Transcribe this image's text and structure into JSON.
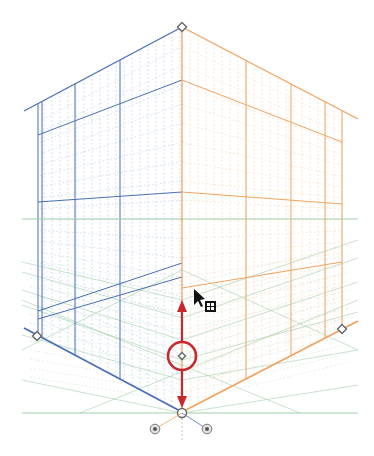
{
  "tool": {
    "name": "Perspective Grid",
    "mode": "two-point",
    "active_widget": "vertical-grid-extent"
  },
  "colors": {
    "left_plane": "#4a6fb5",
    "left_plane_minor": "#b9c8e4",
    "right_plane": "#f0a460",
    "right_plane_minor": "#f6d3b2",
    "ground_plane": "#8fc49a",
    "ground_plane_minor": "#c9e2cd",
    "horizon": "#9fcfa8",
    "active_widget": "#c8282c",
    "handle_stroke": "#666666",
    "handle_fill": "#ffffff",
    "cursor": "#111111"
  },
  "widgets": {
    "top_handle": "vertical-grid-extent-handle",
    "left_handle": "left-grid-extent-handle",
    "right_handle": "right-grid-extent-handle",
    "origin_handle": "ground-level-handle",
    "center_handle": "grid-cell-size-handle",
    "left_ground_widget": "left-plane-ground-widget",
    "right_ground_widget": "right-plane-ground-widget"
  },
  "cursor": {
    "type": "arrow",
    "badge": "grid-move-badge"
  }
}
